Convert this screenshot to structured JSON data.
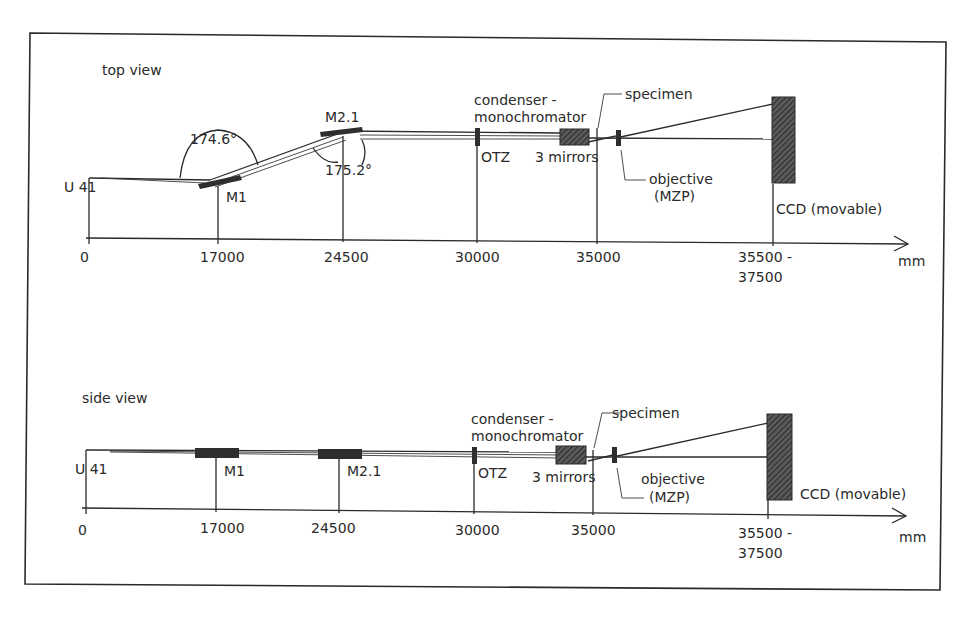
{
  "diagram": {
    "units_label": "mm",
    "views": [
      {
        "id": "top",
        "title": "top view",
        "source_label": "U 41",
        "axis_ticks": [
          "0",
          "17000",
          "24500",
          "30000",
          "35000",
          "35500 -",
          "37500"
        ],
        "components": {
          "m1": "M1",
          "m21": "M2.1",
          "otz": "OTZ",
          "condenser_line1": "condenser -",
          "condenser_line2": "monochromator",
          "mirrors": "3 mirrors",
          "specimen": "specimen",
          "objective_line1": "objective",
          "objective_line2": "(MZP)",
          "ccd": "CCD (movable)"
        },
        "angles": [
          "174.6°",
          "175.2°"
        ]
      },
      {
        "id": "side",
        "title": "side view",
        "source_label": "U 41",
        "axis_ticks": [
          "0",
          "17000",
          "24500",
          "30000",
          "35000",
          "35500 -",
          "37500"
        ],
        "components": {
          "m1": "M1",
          "m21": "M2.1",
          "otz": "OTZ",
          "condenser_line1": "condenser -",
          "condenser_line2": "monochromator",
          "mirrors": "3 mirrors",
          "specimen": "specimen",
          "objective_line1": "objective",
          "objective_line2": "(MZP)",
          "ccd": "CCD (movable)"
        }
      }
    ]
  }
}
